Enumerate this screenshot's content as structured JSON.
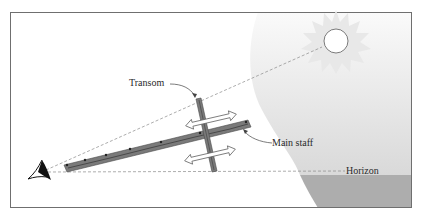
{
  "diagram": {
    "type": "cross-staff sighting diagram",
    "labels": {
      "transom": "Transom",
      "main_staff": "Main staff",
      "horizon": "Horizon"
    },
    "elements": [
      "eye",
      "main staff",
      "transom",
      "sun",
      "sky",
      "sea",
      "sight lines"
    ],
    "colors": {
      "frame": "#6f6f6f",
      "background": "#ffffff",
      "sky_light": "#f4f4f4",
      "sky_dark": "#dedede",
      "sea": "#adadad",
      "staff": "#7a7a7a",
      "staff_edge": "#3c3c3c",
      "sun_rays": "#e6e6e6",
      "dashed_line": "#8a8a8a"
    }
  }
}
